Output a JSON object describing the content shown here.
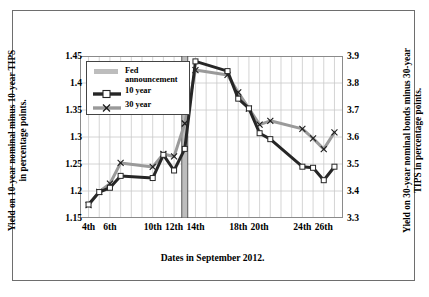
{
  "figure": {
    "xlabel": "Dates in September 2012.",
    "ylabel_left": "Yield on 10-year nominal minus 10-year TIPS in percentage points.",
    "ylabel_right": "Yield on 30-year nominal bonds minus 30-year TIPS in percentage points."
  },
  "legend": {
    "items": [
      {
        "label": "Fed announcement",
        "symbol": "gray-band",
        "color": "#bdbdbd"
      },
      {
        "label": "10 year",
        "symbol": "line-square-marker",
        "color": "#262626"
      },
      {
        "label": "30 year",
        "symbol": "line-x-marker",
        "color": "#9a9a9a"
      }
    ]
  },
  "chart_data": {
    "type": "line",
    "title": "",
    "xlabel": "Dates in September 2012.",
    "ylabel": "Yield on 10-year nominal minus 10-year TIPS in percentage points.",
    "ylabel_secondary": "Yield on 30-year nominal bonds minus 30-year TIPS in percentage points.",
    "grid": true,
    "legend_position": "upper-left-inside",
    "x": [
      4,
      5,
      6,
      7,
      10,
      11,
      12,
      13,
      14,
      17,
      18,
      19,
      20,
      21,
      24,
      25,
      26,
      27
    ],
    "x_tick_positions": [
      4,
      6,
      10,
      12,
      14,
      18,
      20,
      24,
      26
    ],
    "x_tick_labels": [
      "4th",
      "6th",
      "10th",
      "12th",
      "14th",
      "18th",
      "20th",
      "24th",
      "26th"
    ],
    "xlim": [
      3.2,
      27.8
    ],
    "ylim": [
      1.15,
      1.45
    ],
    "y_ticks": [
      1.15,
      1.2,
      1.25,
      1.3,
      1.35,
      1.4,
      1.45
    ],
    "y_tick_labels": [
      "1.15",
      "1.2",
      "1.25",
      "1.3",
      "1.35",
      "1.4",
      "1.45"
    ],
    "ylim_secondary": [
      3.3,
      3.9
    ],
    "y_ticks_secondary": [
      3.3,
      3.4,
      3.5,
      3.6,
      3.7,
      3.8,
      3.9
    ],
    "y_tick_labels_secondary": [
      "3.3",
      "3.4",
      "3.5",
      "3.6",
      "3.7",
      "3.8",
      "3.9"
    ],
    "annotations": [
      {
        "type": "vertical-band",
        "label": "Fed announcement",
        "x_start": 12.72,
        "x_end": 13.28,
        "color": "#bdbdbd"
      }
    ],
    "series": [
      {
        "name": "10 year",
        "axis": "left",
        "color": "#262626",
        "marker": "square",
        "values": [
          1.175,
          1.198,
          1.206,
          1.228,
          1.224,
          1.267,
          1.238,
          1.278,
          1.44,
          1.422,
          1.371,
          1.353,
          1.307,
          1.296,
          1.245,
          1.243,
          1.22,
          1.245
        ]
      },
      {
        "name": "30 year",
        "axis": "right",
        "color": "#9a9a9a",
        "marker": "x",
        "values": [
          3.348,
          3.397,
          3.427,
          3.504,
          3.489,
          3.537,
          3.528,
          3.65,
          3.848,
          3.83,
          3.765,
          3.705,
          3.646,
          3.66,
          3.63,
          3.595,
          3.555,
          3.617
        ]
      }
    ]
  }
}
